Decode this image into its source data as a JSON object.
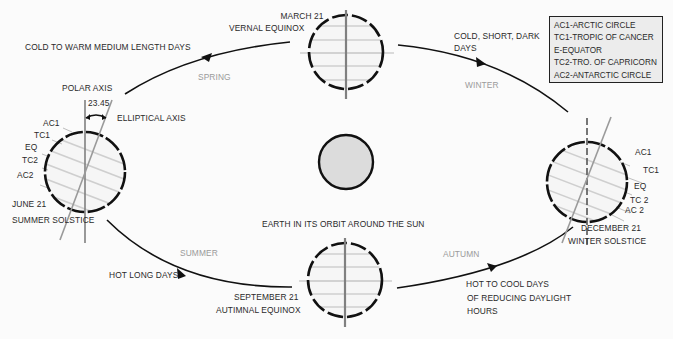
{
  "diagram": {
    "title": "EARTH IN ITS ORBIT AROUND THE SUN",
    "sun": {
      "label": "SUN",
      "fill": "#dcdcdc"
    },
    "positions": {
      "vernal": {
        "date": "MARCH 21",
        "name": "VERNAL EQUINOX"
      },
      "summer": {
        "date": "JUNE 21",
        "name": "SUMMER SOLSTICE"
      },
      "autumnal": {
        "date": "SEPTEMBER 21",
        "name": "AUTIMNAL EQUINOX"
      },
      "winter": {
        "date": "DECEMBER 21",
        "name": "WINTER SOLSTICE"
      }
    },
    "seasons": {
      "spring": "SPRING",
      "summer": "SUMMER",
      "autumn": "AUTUMN",
      "winter": "WINTER"
    },
    "descriptions": {
      "spring": "COLD TO WARM MEDIUM LENGTH DAYS",
      "summer": "HOT LONG DAYS",
      "autumn_line1": "HOT TO COOL DAYS",
      "autumn_line2": "OF REDUCING DAYLIGHT",
      "autumn_line3": "HOURS",
      "winter_line1": "COLD, SHORT, DARK",
      "winter_line2": "DAYS"
    },
    "axis_labels": {
      "polar": "POLAR AXIS",
      "angle": "23.45",
      "elliptical": "ELLIPTICAL AXIS"
    },
    "latitude_labels": {
      "june": [
        "AC1",
        "TC1",
        "EQ",
        "TC2",
        "AC2"
      ],
      "december": [
        "AC1",
        "TC1",
        "EQ",
        "TC 2",
        "AC 2"
      ]
    },
    "legend": [
      "AC1-ARCTIC CIRCLE",
      "TC1-TROPIC OF CANCER",
      "E-EQUATOR",
      "TC2-TRO. OF CAPRICORN",
      "AC2-ANTARCTIC CIRCLE"
    ],
    "colors": {
      "orbit": "#111111",
      "globe_outline": "#111111",
      "latitude_lines": "#c8c8c8",
      "polar_axis": "#808080",
      "season_text": "#9a9a9a"
    }
  }
}
